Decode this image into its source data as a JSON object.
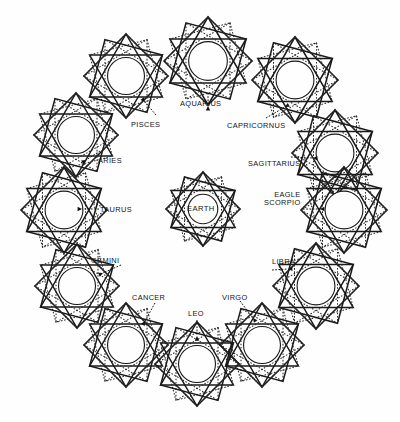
{
  "figure": {
    "center": {
      "name": "EARTH",
      "label": "EARTH",
      "cx": 203,
      "cy": 209,
      "r": 37,
      "inner_r": 21
    },
    "colors": {
      "background": "#fefefe",
      "ink": "#111111",
      "solid_stroke": "#1a1a1a",
      "dotted_stroke": "#2b2b2b"
    },
    "star": {
      "points": 12,
      "solid_polygons": 2,
      "dotted_polygons": 2,
      "outer_radius": 44,
      "inner_radius": 25
    }
  },
  "signs": [
    {
      "id": "aquarius",
      "label": "AQUARIUS",
      "cx": 208,
      "cy": 61,
      "r": 44,
      "label_x": 180,
      "label_y": 100,
      "arrow": {
        "x1": 208,
        "y1": 106,
        "x2": 208,
        "y2": 93
      },
      "lines": [
        "AQUARIUS"
      ]
    },
    {
      "id": "capricornus",
      "label": "CAPRICORNUS",
      "cx": 295,
      "cy": 80,
      "r": 43,
      "label_x": 227,
      "label_y": 122,
      "arrow": {
        "x1": 285,
        "y1": 107,
        "x2": 266,
        "y2": 118
      },
      "lines": [
        "CAPRICORNUS"
      ]
    },
    {
      "id": "sagittarius",
      "label": "SAGITTARIUS",
      "cx": 335,
      "cy": 153,
      "r": 43,
      "label_x": 248,
      "label_y": 160,
      "arrow": {
        "x1": 313,
        "y1": 158,
        "x2": 291,
        "y2": 157
      },
      "lines": [
        "SAGITTARIUS"
      ]
    },
    {
      "id": "scorpio",
      "label": "EAGLE SCORPIO",
      "cx": 344,
      "cy": 210,
      "r": 43,
      "label_x": 264,
      "label_y": 191,
      "arrow": {
        "x1": 320,
        "y1": 209,
        "x2": 303,
        "y2": 209
      },
      "lines": [
        "EAGLE",
        "SCORPIO"
      ]
    },
    {
      "id": "libra",
      "label": "LIBRA",
      "cx": 316,
      "cy": 286,
      "r": 43,
      "label_x": 272,
      "label_y": 258,
      "arrow": {
        "x1": 288,
        "y1": 269,
        "x2": 272,
        "y2": 270
      },
      "lines": [
        "LIBRA"
      ]
    },
    {
      "id": "virgo",
      "label": "VIRGO",
      "cx": 262,
      "cy": 345,
      "r": 42,
      "label_x": 222,
      "label_y": 294,
      "arrow": {
        "x1": 253,
        "y1": 318,
        "x2": 240,
        "y2": 301
      },
      "lines": [
        "VIRGO"
      ]
    },
    {
      "id": "leo",
      "label": "LEO",
      "cx": 197,
      "cy": 364,
      "r": 42,
      "label_x": 188,
      "label_y": 310,
      "arrow": {
        "x1": 197,
        "y1": 336,
        "x2": 197,
        "y2": 320
      },
      "lines": [
        "LEO"
      ]
    },
    {
      "id": "cancer",
      "label": "CANCER",
      "cx": 126,
      "cy": 345,
      "r": 42,
      "label_x": 132,
      "label_y": 294,
      "arrow": {
        "x1": 145,
        "y1": 321,
        "x2": 155,
        "y2": 303
      },
      "lines": [
        "CANCER"
      ]
    },
    {
      "id": "gemini",
      "label": "GEMINI",
      "cx": 77,
      "cy": 286,
      "r": 42,
      "label_x": 91,
      "label_y": 257,
      "arrow": {
        "x1": 103,
        "y1": 273,
        "x2": 121,
        "y2": 265
      },
      "lines": [
        "GEMINI"
      ]
    },
    {
      "id": "taurus",
      "label": "TAURUS",
      "cx": 64,
      "cy": 210,
      "r": 43,
      "label_x": 100,
      "label_y": 206,
      "arrow": {
        "x1": 82,
        "y1": 209,
        "x2": 99,
        "y2": 209
      },
      "lines": [
        "TAURUS"
      ]
    },
    {
      "id": "aries",
      "label": "ARIES",
      "cx": 76,
      "cy": 135,
      "r": 42,
      "label_x": 98,
      "label_y": 157,
      "arrow": {
        "x1": 86,
        "y1": 160,
        "x2": 100,
        "y2": 151
      },
      "lines": [
        "ARIES"
      ]
    },
    {
      "id": "pisces",
      "label": "PISCES",
      "cx": 126,
      "cy": 76,
      "r": 42,
      "label_x": 131,
      "label_y": 121,
      "arrow": {
        "x1": 145,
        "y1": 102,
        "x2": 156,
        "y2": 115
      },
      "lines": [
        "PISCES"
      ]
    }
  ]
}
